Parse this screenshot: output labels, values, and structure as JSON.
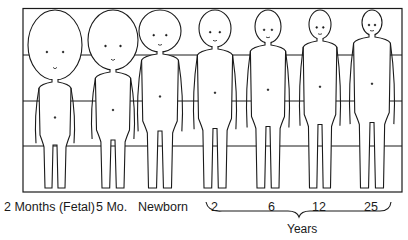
{
  "diagram": {
    "grid": {
      "rows": 4,
      "frame_color": "#1a1a1a"
    },
    "figures": [
      {
        "id": "2-months-fetal",
        "label": "2 Months (Fetal)",
        "cx": 55,
        "head_top": 10,
        "head_bottom": 80,
        "head_w": 54,
        "body_w": 40,
        "feet": 190
      },
      {
        "id": "5-months",
        "label": "5 Mo.",
        "cx": 113,
        "head_top": 10,
        "head_bottom": 70,
        "head_w": 50,
        "body_w": 44,
        "feet": 190
      },
      {
        "id": "newborn",
        "label": "Newborn",
        "cx": 160,
        "head_top": 10,
        "head_bottom": 52,
        "head_w": 42,
        "body_w": 46,
        "feet": 190
      },
      {
        "id": "age-2",
        "label": "2",
        "cx": 215,
        "head_top": 10,
        "head_bottom": 47,
        "head_w": 32,
        "body_w": 44,
        "feet": 190
      },
      {
        "id": "age-6",
        "label": "6",
        "cx": 268,
        "head_top": 10,
        "head_bottom": 43,
        "head_w": 26,
        "body_w": 44,
        "feet": 190
      },
      {
        "id": "age-12",
        "label": "12",
        "cx": 320,
        "head_top": 10,
        "head_bottom": 39,
        "head_w": 22,
        "body_w": 42,
        "feet": 190
      },
      {
        "id": "age-25",
        "label": "25",
        "cx": 372,
        "head_top": 10,
        "head_bottom": 35,
        "head_w": 20,
        "body_w": 46,
        "feet": 190
      }
    ],
    "labels": {
      "fetal": "2 Months (Fetal)",
      "five_mo": "5 Mo.",
      "newborn": "Newborn",
      "age2": "2",
      "age6": "6",
      "age12": "12",
      "age25": "25",
      "years": "Years"
    }
  }
}
